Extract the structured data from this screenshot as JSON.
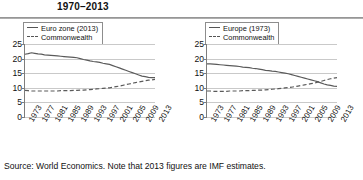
{
  "header": {
    "title": "1970–2013"
  },
  "source_note": "Source: World Economics. Note that 2013 figures are IMF estimates.",
  "chart_data": [
    {
      "type": "line",
      "panel": "left",
      "title": "",
      "xlabel": "",
      "ylabel": "",
      "ylim": [
        0,
        25
      ],
      "yticks": [
        0,
        5,
        10,
        15,
        20,
        25
      ],
      "grid": true,
      "legend_position": "top-left",
      "x": [
        1973,
        1974,
        1975,
        1976,
        1977,
        1978,
        1979,
        1980,
        1981,
        1982,
        1983,
        1984,
        1985,
        1986,
        1987,
        1988,
        1989,
        1990,
        1991,
        1992,
        1993,
        1994,
        1995,
        1996,
        1997,
        1998,
        1999,
        2000,
        2001,
        2002,
        2003,
        2004,
        2005,
        2006,
        2007,
        2008,
        2009,
        2010,
        2011,
        2012,
        2013
      ],
      "xtick_labels": [
        "1973",
        "1977",
        "1981",
        "1985",
        "1989",
        "1993",
        "1997",
        "2001",
        "2005",
        "2009",
        "2013"
      ],
      "series": [
        {
          "name": "Euro zone (2013)",
          "style": "solid",
          "values": [
            21.5,
            21.7,
            22.0,
            21.8,
            21.6,
            21.5,
            21.3,
            21.2,
            21.1,
            21.0,
            20.9,
            20.8,
            20.7,
            20.6,
            20.5,
            20.4,
            20.3,
            20.0,
            19.7,
            19.5,
            19.2,
            19.0,
            18.9,
            18.7,
            18.4,
            18.2,
            18.0,
            17.6,
            17.2,
            16.8,
            16.4,
            16.0,
            15.6,
            15.2,
            14.8,
            14.4,
            14.0,
            13.8,
            13.6,
            13.5,
            13.5
          ]
        },
        {
          "name": "Commonwealth",
          "style": "dashed",
          "values": [
            9.1,
            9.0,
            8.9,
            8.9,
            8.9,
            8.9,
            8.9,
            8.9,
            8.9,
            8.9,
            8.9,
            9.0,
            9.0,
            9.0,
            9.0,
            9.1,
            9.1,
            9.2,
            9.2,
            9.3,
            9.4,
            9.5,
            9.6,
            9.7,
            9.8,
            9.9,
            10.0,
            10.2,
            10.4,
            10.6,
            10.8,
            11.1,
            11.3,
            11.5,
            11.8,
            12.0,
            12.2,
            12.4,
            12.6,
            12.7,
            12.9
          ]
        }
      ]
    },
    {
      "type": "line",
      "panel": "right",
      "title": "",
      "xlabel": "",
      "ylabel": "",
      "ylim": [
        0,
        25
      ],
      "yticks": [
        0,
        5,
        10,
        15,
        20,
        25
      ],
      "grid": true,
      "legend_position": "top-left",
      "x": [
        1973,
        1974,
        1975,
        1976,
        1977,
        1978,
        1979,
        1980,
        1981,
        1982,
        1983,
        1984,
        1985,
        1986,
        1987,
        1988,
        1989,
        1990,
        1991,
        1992,
        1993,
        1994,
        1995,
        1996,
        1997,
        1998,
        1999,
        2000,
        2001,
        2002,
        2003,
        2004,
        2005,
        2006,
        2007,
        2008,
        2009,
        2010,
        2011,
        2012,
        2013
      ],
      "xtick_labels": [
        "1973",
        "1977",
        "1981",
        "1985",
        "1989",
        "1993",
        "1997",
        "2001",
        "2005",
        "2009",
        "2013"
      ],
      "series": [
        {
          "name": "Europe (1973)",
          "style": "solid",
          "values": [
            18.2,
            18.2,
            18.1,
            18.0,
            17.9,
            17.8,
            17.7,
            17.6,
            17.5,
            17.4,
            17.3,
            17.1,
            17.0,
            16.9,
            16.7,
            16.6,
            16.4,
            16.2,
            16.0,
            15.9,
            15.7,
            15.6,
            15.4,
            15.2,
            15.0,
            14.8,
            14.5,
            14.2,
            13.9,
            13.6,
            13.3,
            13.0,
            12.7,
            12.4,
            12.1,
            11.7,
            11.3,
            11.0,
            10.8,
            10.6,
            10.5
          ]
        },
        {
          "name": "Commonwealth",
          "style": "dashed",
          "values": [
            8.9,
            8.9,
            8.8,
            8.8,
            8.8,
            8.8,
            8.8,
            8.9,
            8.9,
            8.9,
            8.9,
            9.0,
            9.0,
            9.0,
            9.1,
            9.1,
            9.2,
            9.2,
            9.3,
            9.4,
            9.5,
            9.6,
            9.7,
            9.8,
            10.0,
            10.1,
            10.2,
            10.4,
            10.6,
            10.8,
            11.0,
            11.2,
            11.4,
            11.6,
            11.9,
            12.2,
            12.5,
            12.8,
            13.1,
            13.3,
            13.5
          ]
        }
      ]
    }
  ]
}
